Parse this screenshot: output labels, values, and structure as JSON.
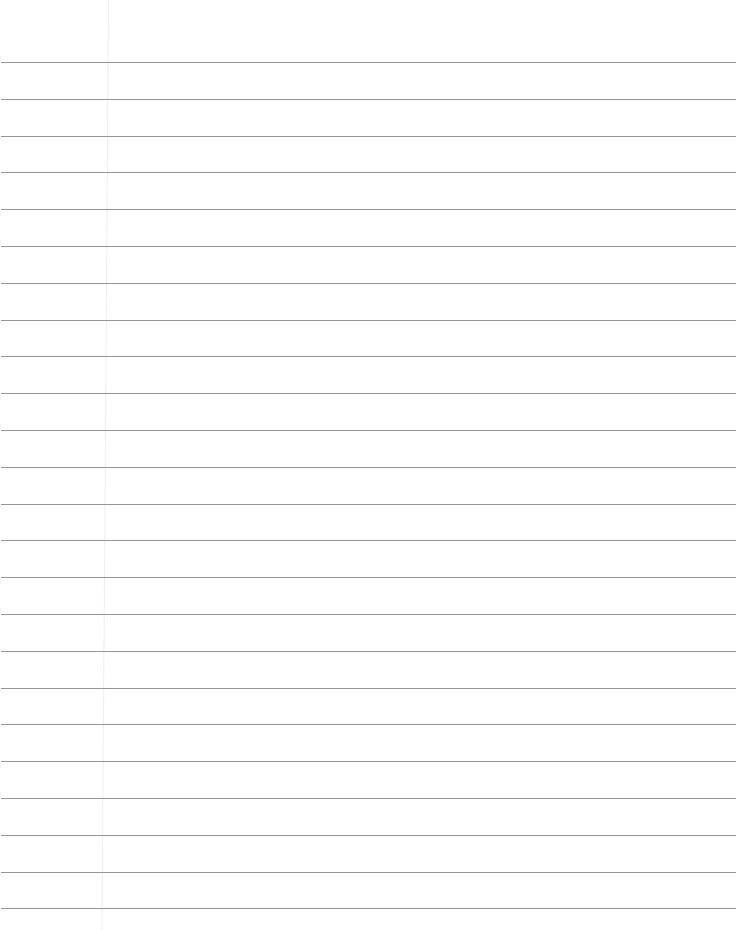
{
  "sheet": {
    "type": "lined-paper",
    "background": "#ffffff",
    "rule_color": "#8a8a8a",
    "margin_color": "#eeeeee",
    "rule_count": 24,
    "first_rule_y": 62,
    "rule_spacing": 36.8,
    "margin_x": 108
  }
}
